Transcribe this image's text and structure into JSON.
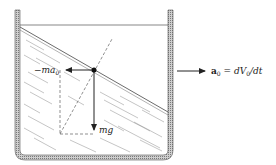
{
  "diagram": {
    "type": "physics-free-body",
    "labels": {
      "inertial_force": "−ma",
      "inertial_force_sub": "0",
      "gravity_force": "mg",
      "acceleration_symbol": "a",
      "acceleration_sub": "0",
      "acceleration_eq": " = dV",
      "acceleration_eq_sub": "0",
      "acceleration_eq_tail": "/dt"
    },
    "colors": {
      "stroke": "#222222",
      "wall_fill": "#9a9a9a",
      "hatch": "#8a8a8a"
    }
  }
}
